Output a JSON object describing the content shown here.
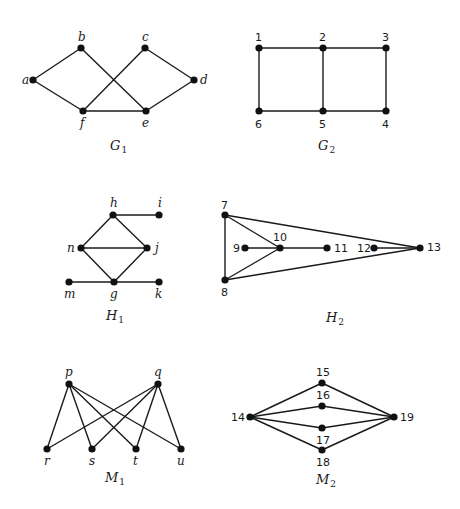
{
  "graphs": [
    {
      "id": "G1",
      "label": "G",
      "subscript": "1",
      "label_pos": [
        110,
        150
      ],
      "label_style": "italic",
      "vertices": [
        {
          "name": "a",
          "x": 33,
          "y": 80,
          "lx": 22,
          "ly": 84
        },
        {
          "name": "b",
          "x": 81,
          "y": 48,
          "lx": 78,
          "ly": 41
        },
        {
          "name": "c",
          "x": 145,
          "y": 48,
          "lx": 142,
          "ly": 41
        },
        {
          "name": "d",
          "x": 194,
          "y": 80,
          "lx": 200,
          "ly": 84
        },
        {
          "name": "e",
          "x": 146,
          "y": 111,
          "lx": 142,
          "ly": 127
        },
        {
          "name": "f",
          "x": 83,
          "y": 111,
          "lx": 80,
          "ly": 127
        }
      ],
      "edges": [
        [
          "a",
          "b"
        ],
        [
          "a",
          "f"
        ],
        [
          "b",
          "e"
        ],
        [
          "c",
          "f"
        ],
        [
          "c",
          "d"
        ],
        [
          "d",
          "e"
        ],
        [
          "f",
          "e"
        ]
      ]
    },
    {
      "id": "G2",
      "label": "G",
      "subscript": "2",
      "label_pos": [
        318,
        150
      ],
      "label_style": "upright",
      "vertices": [
        {
          "name": "1",
          "x": 259,
          "y": 48,
          "lx": 255,
          "ly": 41
        },
        {
          "name": "2",
          "x": 323,
          "y": 48,
          "lx": 319,
          "ly": 41
        },
        {
          "name": "3",
          "x": 386,
          "y": 48,
          "lx": 382,
          "ly": 41
        },
        {
          "name": "4",
          "x": 386,
          "y": 111,
          "lx": 382,
          "ly": 128
        },
        {
          "name": "5",
          "x": 323,
          "y": 111,
          "lx": 319,
          "ly": 128
        },
        {
          "name": "6",
          "x": 259,
          "y": 111,
          "lx": 255,
          "ly": 128
        }
      ],
      "edges": [
        [
          "1",
          "2"
        ],
        [
          "2",
          "3"
        ],
        [
          "1",
          "6"
        ],
        [
          "2",
          "5"
        ],
        [
          "3",
          "4"
        ],
        [
          "6",
          "5"
        ],
        [
          "5",
          "4"
        ]
      ]
    },
    {
      "id": "H1",
      "label": "H",
      "subscript": "1",
      "label_pos": [
        106,
        320
      ],
      "label_style": "italic",
      "vertices": [
        {
          "name": "h",
          "x": 113,
          "y": 215,
          "lx": 110,
          "ly": 207
        },
        {
          "name": "i",
          "x": 159,
          "y": 215,
          "lx": 158,
          "ly": 207
        },
        {
          "name": "j",
          "x": 147,
          "y": 248,
          "lx": 155,
          "ly": 252
        },
        {
          "name": "n",
          "x": 81,
          "y": 248,
          "lx": 67,
          "ly": 252
        },
        {
          "name": "m",
          "x": 69,
          "y": 282,
          "lx": 64,
          "ly": 298
        },
        {
          "name": "g",
          "x": 114,
          "y": 282,
          "lx": 110,
          "ly": 298
        },
        {
          "name": "k",
          "x": 159,
          "y": 282,
          "lx": 155,
          "ly": 298
        }
      ],
      "edges": [
        [
          "h",
          "i"
        ],
        [
          "h",
          "n"
        ],
        [
          "h",
          "j"
        ],
        [
          "n",
          "j"
        ],
        [
          "n",
          "g"
        ],
        [
          "j",
          "g"
        ],
        [
          "m",
          "g"
        ],
        [
          "g",
          "k"
        ]
      ]
    },
    {
      "id": "H2",
      "label": "H",
      "subscript": "2",
      "label_pos": [
        326,
        322
      ],
      "label_style": "italic",
      "vertices": [
        {
          "name": "7",
          "x": 225,
          "y": 215,
          "lx": 221,
          "ly": 209
        },
        {
          "name": "8",
          "x": 225,
          "y": 280,
          "lx": 221,
          "ly": 296
        },
        {
          "name": "9",
          "x": 245,
          "y": 248,
          "lx": 233,
          "ly": 252
        },
        {
          "name": "10",
          "x": 280,
          "y": 248,
          "lx": 273,
          "ly": 241
        },
        {
          "name": "11",
          "x": 327,
          "y": 248,
          "lx": 334,
          "ly": 252
        },
        {
          "name": "12",
          "x": 374,
          "y": 248,
          "lx": 357,
          "ly": 252
        },
        {
          "name": "13",
          "x": 420,
          "y": 248,
          "lx": 427,
          "ly": 251
        }
      ],
      "edges": [
        [
          "7",
          "8"
        ],
        [
          "7",
          "10"
        ],
        [
          "8",
          "10"
        ],
        [
          "9",
          "10"
        ],
        [
          "10",
          "11"
        ],
        [
          "12",
          "13"
        ],
        [
          "7",
          "13"
        ],
        [
          "8",
          "13"
        ]
      ]
    },
    {
      "id": "M1",
      "label": "M",
      "subscript": "1",
      "label_pos": [
        105,
        482
      ],
      "label_style": "italic",
      "vertices": [
        {
          "name": "p",
          "x": 69,
          "y": 384,
          "lx": 65,
          "ly": 376
        },
        {
          "name": "q",
          "x": 158,
          "y": 384,
          "lx": 154,
          "ly": 376
        },
        {
          "name": "r",
          "x": 47,
          "y": 449,
          "lx": 44,
          "ly": 465
        },
        {
          "name": "s",
          "x": 92,
          "y": 449,
          "lx": 89,
          "ly": 465
        },
        {
          "name": "t",
          "x": 136,
          "y": 449,
          "lx": 133,
          "ly": 465
        },
        {
          "name": "u",
          "x": 181,
          "y": 449,
          "lx": 177,
          "ly": 465
        }
      ],
      "edges": [
        [
          "p",
          "r"
        ],
        [
          "p",
          "s"
        ],
        [
          "p",
          "t"
        ],
        [
          "p",
          "u"
        ],
        [
          "q",
          "r"
        ],
        [
          "q",
          "s"
        ],
        [
          "q",
          "t"
        ],
        [
          "q",
          "u"
        ]
      ]
    },
    {
      "id": "M2",
      "label": "M",
      "subscript": "2",
      "label_pos": [
        316,
        484
      ],
      "label_style": "italic",
      "vertices": [
        {
          "name": "14",
          "x": 250,
          "y": 417,
          "lx": 231,
          "ly": 421
        },
        {
          "name": "15",
          "x": 322,
          "y": 383,
          "lx": 316,
          "ly": 376
        },
        {
          "name": "16",
          "x": 322,
          "y": 406,
          "lx": 316,
          "ly": 399
        },
        {
          "name": "17",
          "x": 322,
          "y": 428,
          "lx": 316,
          "ly": 444
        },
        {
          "name": "18",
          "x": 322,
          "y": 450,
          "lx": 316,
          "ly": 466
        },
        {
          "name": "19",
          "x": 394,
          "y": 417,
          "lx": 400,
          "ly": 421
        }
      ],
      "edges": [
        [
          "14",
          "15"
        ],
        [
          "14",
          "16"
        ],
        [
          "14",
          "17"
        ],
        [
          "14",
          "18"
        ],
        [
          "15",
          "19"
        ],
        [
          "16",
          "19"
        ],
        [
          "17",
          "19"
        ],
        [
          "18",
          "19"
        ]
      ]
    }
  ]
}
